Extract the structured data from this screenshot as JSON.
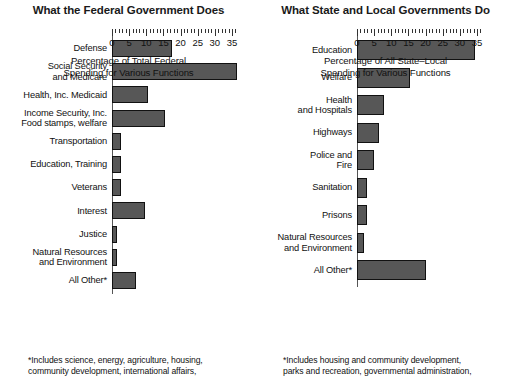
{
  "chart_data": [
    {
      "type": "bar",
      "orientation": "horizontal",
      "title": "What the Federal Government Does",
      "xlabel": "Percentage of Total Federal\nSpending for Various Functions",
      "ylabel": "",
      "xlim": [
        0,
        37.5
      ],
      "xticks": [
        0,
        5,
        10,
        15,
        20,
        25,
        30,
        35
      ],
      "xtick_labels": [
        "0",
        "5",
        "10",
        "15",
        "20",
        "25",
        "30",
        "35"
      ],
      "minor_tick_step": 1,
      "grid": false,
      "legend": null,
      "bar_color": "#575757",
      "categories": [
        "Defense",
        "Social Security\nand Medicare",
        "Health, Inc. Medicaid",
        "Income Security, Inc.\nFood stamps, welfare",
        "Transportation",
        "Education, Training",
        "Veterans",
        "Interest",
        "Justice",
        "Natural Resources\nand Environment",
        "All Other*"
      ],
      "values": [
        17.5,
        36.5,
        10.5,
        15.5,
        2.5,
        2.5,
        2.5,
        9.5,
        1.5,
        1.5,
        7.0
      ],
      "footnote": "*Includes science, energy, agriculture, housing,\ncommunity development, international affairs,"
    },
    {
      "type": "bar",
      "orientation": "horizontal",
      "title": "What State and Local Governments Do",
      "xlabel": "Percentage of All State–Local\nSpending for Various Functions",
      "ylabel": "",
      "xlim": [
        0,
        37.5
      ],
      "xticks": [
        0,
        5,
        10,
        15,
        20,
        25,
        30,
        35
      ],
      "xtick_labels": [
        "0",
        "5",
        "10",
        "15",
        "20",
        "25",
        "30",
        "35"
      ],
      "minor_tick_step": 1,
      "grid": false,
      "legend": null,
      "bar_color": "#575757",
      "categories": [
        "Education",
        "Welfare",
        "Health\nand Hospitals",
        "Highways",
        "Police and\nFire",
        "Sanitation",
        "Prisons",
        "Natural Resources\nand Environment",
        "All Other*"
      ],
      "values": [
        34.5,
        15.5,
        8.0,
        6.5,
        5.0,
        3.0,
        3.0,
        2.0,
        20.0
      ],
      "footnote": "*Includes housing and community development,\nparks and recreation, governmental administration,"
    }
  ]
}
